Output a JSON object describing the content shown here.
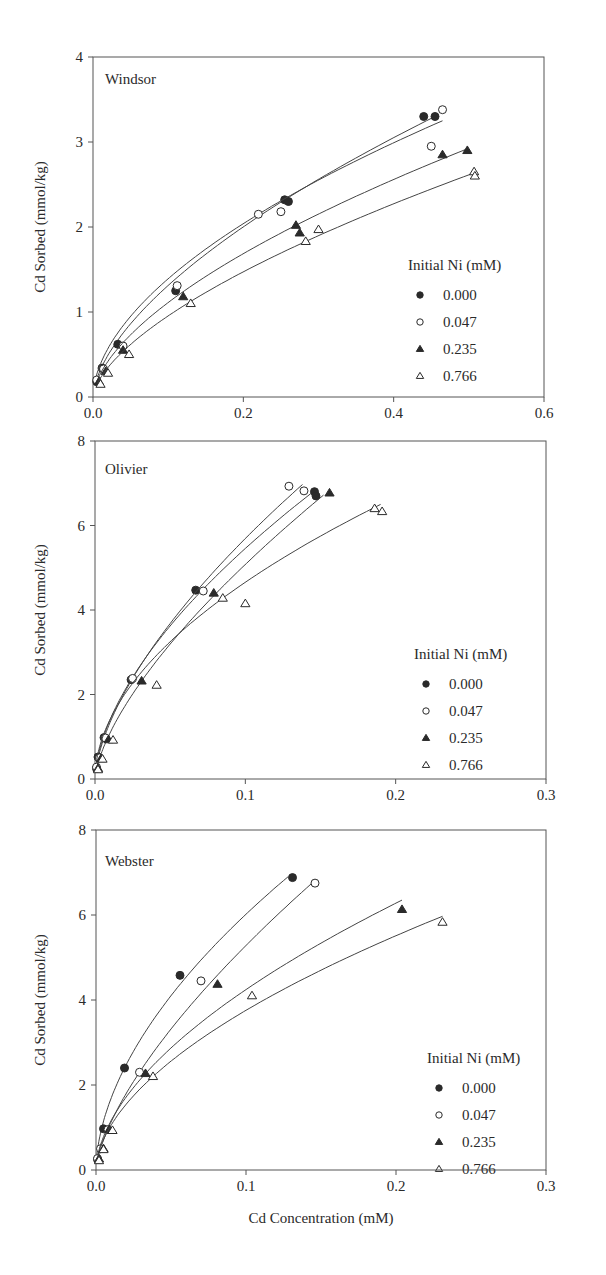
{
  "figure": {
    "shared_xlabel": "Cd Concentration (mM)",
    "shared_ylabel": "Cd Sorbed (mmol/kg)",
    "legend_title": "Initial Ni (mM)",
    "legend_entries": [
      {
        "label": "0.000",
        "marker": "filled-circle"
      },
      {
        "label": "0.047",
        "marker": "open-circle"
      },
      {
        "label": "0.235",
        "marker": "filled-triangle"
      },
      {
        "label": "0.766",
        "marker": "open-triangle"
      }
    ]
  },
  "chart_data": [
    {
      "type": "scatter",
      "title": "Windsor",
      "xlabel": "",
      "ylabel": "Cd Sorbed (mmol/kg)",
      "xlim": [
        0,
        0.6
      ],
      "ylim": [
        0,
        4
      ],
      "xticks": [
        "0.0",
        "0.2",
        "0.4",
        "0.6"
      ],
      "yticks": [
        "0",
        "1",
        "2",
        "3",
        "4"
      ],
      "grid": false,
      "legend_position": "lower right",
      "legend_title": "Initial Ni (mM)",
      "fit_curves": true,
      "series": [
        {
          "name": "0.000",
          "marker": "filled-circle",
          "x": [
            0.005,
            0.012,
            0.033,
            0.11,
            0.255,
            0.26,
            0.44,
            0.455
          ],
          "y": [
            0.18,
            0.34,
            0.62,
            1.25,
            2.32,
            2.3,
            3.3,
            3.3
          ],
          "fit_end": [
            0.455,
            3.3
          ]
        },
        {
          "name": "0.047",
          "marker": "open-circle",
          "x": [
            0.005,
            0.014,
            0.04,
            0.112,
            0.22,
            0.25,
            0.45,
            0.465
          ],
          "y": [
            0.2,
            0.33,
            0.6,
            1.31,
            2.15,
            2.18,
            2.95,
            3.38
          ],
          "fit_end": [
            0.465,
            3.25
          ]
        },
        {
          "name": "0.235",
          "marker": "filled-triangle",
          "x": [
            0.008,
            0.017,
            0.04,
            0.12,
            0.27,
            0.275,
            0.465,
            0.498
          ],
          "y": [
            0.18,
            0.3,
            0.55,
            1.18,
            2.02,
            1.93,
            2.85,
            2.9
          ],
          "fit_end": [
            0.498,
            2.92
          ]
        },
        {
          "name": "0.766",
          "marker": "open-triangle",
          "x": [
            0.01,
            0.02,
            0.048,
            0.13,
            0.283,
            0.3,
            0.507,
            0.508
          ],
          "y": [
            0.15,
            0.28,
            0.5,
            1.1,
            1.83,
            1.97,
            2.65,
            2.6
          ],
          "fit_end": [
            0.505,
            2.63
          ]
        }
      ]
    },
    {
      "type": "scatter",
      "title": "Olivier",
      "xlabel": "",
      "ylabel": "Cd Sorbed (mmol/kg)",
      "xlim": [
        0,
        0.3
      ],
      "ylim": [
        0,
        8
      ],
      "xticks": [
        "0.0",
        "0.1",
        "0.2",
        "0.3"
      ],
      "yticks": [
        "0",
        "2",
        "4",
        "6",
        "8"
      ],
      "grid": false,
      "legend_position": "lower right",
      "legend_title": "Initial Ni (mM)",
      "fit_curves": true,
      "series": [
        {
          "name": "0.000",
          "marker": "filled-circle",
          "x": [
            0.001,
            0.002,
            0.006,
            0.024,
            0.067,
            0.146,
            0.147
          ],
          "y": [
            0.25,
            0.52,
            0.98,
            2.35,
            4.47,
            6.8,
            6.7
          ],
          "fit_end": [
            0.147,
            6.85
          ]
        },
        {
          "name": "0.047",
          "marker": "open-circle",
          "x": [
            0.001,
            0.003,
            0.007,
            0.025,
            0.072,
            0.129,
            0.139
          ],
          "y": [
            0.28,
            0.5,
            0.97,
            2.38,
            4.45,
            6.93,
            6.82
          ],
          "fit_end": [
            0.138,
            6.97
          ]
        },
        {
          "name": "0.235",
          "marker": "filled-triangle",
          "x": [
            0.002,
            0.004,
            0.009,
            0.031,
            0.079,
            0.156
          ],
          "y": [
            0.25,
            0.48,
            0.93,
            2.32,
            4.4,
            6.77
          ],
          "fit_end": [
            0.152,
            6.72
          ]
        },
        {
          "name": "0.766",
          "marker": "open-triangle",
          "x": [
            0.002,
            0.005,
            0.012,
            0.041,
            0.085,
            0.1,
            0.186,
            0.191
          ],
          "y": [
            0.22,
            0.47,
            0.92,
            2.22,
            4.28,
            4.15,
            6.4,
            6.33
          ],
          "fit_end": [
            0.19,
            6.5
          ]
        }
      ]
    },
    {
      "type": "scatter",
      "title": "Webster",
      "xlabel": "Cd Concentration (mM)",
      "ylabel": "Cd Sorbed (mmol/kg)",
      "xlim": [
        0,
        0.3
      ],
      "ylim": [
        0,
        8
      ],
      "xticks": [
        "0.0",
        "0.1",
        "0.2",
        "0.3"
      ],
      "yticks": [
        "0",
        "2",
        "4",
        "6",
        "8"
      ],
      "grid": false,
      "legend_position": "lower right",
      "legend_title": "Initial Ni (mM)",
      "fit_curves": true,
      "series": [
        {
          "name": "0.000",
          "marker": "filled-circle",
          "x": [
            0.001,
            0.005,
            0.019,
            0.056,
            0.131
          ],
          "y": [
            0.25,
            0.97,
            2.4,
            4.58,
            6.88
          ],
          "fit_end": [
            0.128,
            6.9
          ]
        },
        {
          "name": "0.047",
          "marker": "open-circle",
          "x": [
            0.001,
            0.003,
            0.008,
            0.029,
            0.07,
            0.146
          ],
          "y": [
            0.27,
            0.5,
            0.95,
            2.3,
            4.45,
            6.75
          ],
          "fit_end": [
            0.144,
            6.75
          ]
        },
        {
          "name": "0.235",
          "marker": "filled-triangle",
          "x": [
            0.002,
            0.005,
            0.009,
            0.033,
            0.081,
            0.204
          ],
          "y": [
            0.26,
            0.5,
            0.95,
            2.27,
            4.37,
            6.13
          ],
          "fit_end": [
            0.204,
            6.35
          ]
        },
        {
          "name": "0.766",
          "marker": "open-triangle",
          "x": [
            0.002,
            0.005,
            0.011,
            0.038,
            0.104,
            0.231
          ],
          "y": [
            0.22,
            0.48,
            0.93,
            2.2,
            4.1,
            5.83
          ],
          "fit_end": [
            0.231,
            5.97
          ]
        }
      ]
    }
  ]
}
